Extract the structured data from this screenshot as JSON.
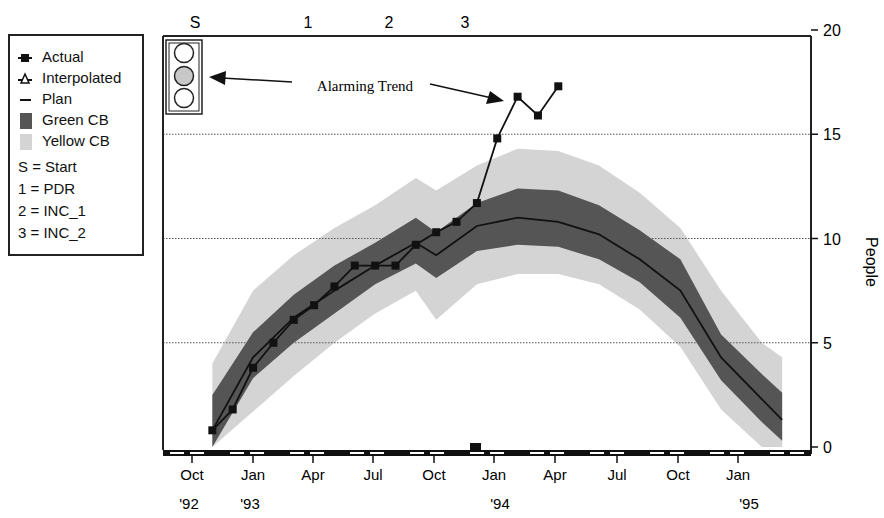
{
  "legend": {
    "items": [
      {
        "label": "Actual",
        "symbol": "square-marker-line"
      },
      {
        "label": "Interpolated",
        "symbol": "triangle-marker-line"
      },
      {
        "label": "Plan",
        "symbol": "line"
      },
      {
        "label": "Green CB",
        "symbol": "dark-fill"
      },
      {
        "label": "Yellow CB",
        "symbol": "light-fill"
      }
    ],
    "milestones": [
      {
        "label": "S = Start"
      },
      {
        "label": "1 = PDR"
      },
      {
        "label": "2 = INC_1"
      },
      {
        "label": "3 = INC_2"
      }
    ]
  },
  "top_markers": [
    "S",
    "1",
    "2",
    "3"
  ],
  "annotation": {
    "text": "Alarming Trend"
  },
  "traffic_light": {
    "lit": "middle",
    "lit_color": "#c8c8c8"
  },
  "colors": {
    "green_cb": "#555555",
    "yellow_cb": "#d4d4d4",
    "line": "#111111"
  },
  "yaxis": {
    "label": "People",
    "ticks": [
      "0",
      "5",
      "10",
      "15",
      "20"
    ]
  },
  "xaxis": {
    "months": [
      "Oct",
      "Jan",
      "Apr",
      "Jul",
      "Oct",
      "Jan",
      "Apr",
      "Jul",
      "Oct",
      "Jan"
    ],
    "years": [
      "'92",
      "'93",
      "'94",
      "'95"
    ]
  },
  "chart_data": {
    "type": "line",
    "title": "",
    "xlabel": "",
    "ylabel": "People",
    "ylim": [
      0,
      20
    ],
    "grid": "horizontal dotted at 5, 10, 15",
    "legend_position": "left, outside plot",
    "x_tick_labels": [
      "Oct '92",
      "Jan '93",
      "Apr",
      "Jul",
      "Oct",
      "Jan '94",
      "Apr",
      "Jul",
      "Oct",
      "Jan '95"
    ],
    "milestones": {
      "S": "Start (~Oct '92)",
      "1": "PDR (~Apr '93)",
      "2": "INC_1 (~Aug '93)",
      "3": "INC_2 (~Nov '93)"
    },
    "annotations": [
      "Alarming Trend"
    ],
    "series": [
      {
        "name": "Actual",
        "x": [
          "Nov '92",
          "Dec '92",
          "Jan '93",
          "Feb '93",
          "Mar '93",
          "Apr '93",
          "May '93",
          "Jun '93",
          "Jul '93",
          "Aug '93",
          "Sep '93",
          "Oct '93",
          "Nov '93",
          "Dec '93",
          "Jan '94",
          "Feb '94",
          "Mar '94",
          "Apr '94"
        ],
        "values": [
          0.8,
          1.8,
          3.8,
          5.0,
          6.1,
          6.8,
          7.7,
          8.7,
          8.7,
          8.7,
          9.7,
          10.3,
          10.8,
          11.7,
          14.8,
          16.8,
          15.9,
          17.3
        ]
      },
      {
        "name": "Plan",
        "x": [
          "Nov '92",
          "Jan '93",
          "Mar '93",
          "May '93",
          "Jul '93",
          "Sep '93",
          "Oct '93",
          "Dec '93",
          "Feb '94",
          "Apr '94",
          "Jun '94",
          "Aug '94",
          "Oct '94",
          "Dec '94",
          "Feb '95",
          "Mar '95"
        ],
        "values": [
          0.8,
          4.3,
          6.2,
          7.5,
          8.7,
          9.8,
          9.2,
          10.6,
          11.0,
          10.8,
          10.2,
          9.0,
          7.5,
          4.3,
          2.3,
          1.3
        ]
      },
      {
        "name": "Green CB",
        "lower": [
          0,
          3.3,
          5.0,
          6.4,
          7.8,
          8.8,
          8.1,
          9.4,
          9.7,
          9.6,
          9.0,
          7.9,
          6.2,
          3.2,
          1.2,
          0.3
        ],
        "upper": [
          2.5,
          5.5,
          7.3,
          8.7,
          9.8,
          11.0,
          10.3,
          11.7,
          12.4,
          12.3,
          11.6,
          10.4,
          9.0,
          5.4,
          3.5,
          2.6
        ]
      },
      {
        "name": "Yellow CB",
        "lower": [
          0,
          1.7,
          3.4,
          5.0,
          6.4,
          7.5,
          6.1,
          7.8,
          8.3,
          8.3,
          7.8,
          6.6,
          4.8,
          1.8,
          0,
          0
        ],
        "upper": [
          4.0,
          7.5,
          9.2,
          10.5,
          11.6,
          12.9,
          12.3,
          13.5,
          14.3,
          14.2,
          13.5,
          12.2,
          10.5,
          7.5,
          5.0,
          4.3
        ]
      }
    ]
  }
}
